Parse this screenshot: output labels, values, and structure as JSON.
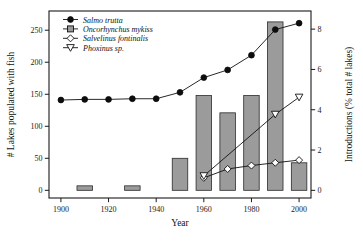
{
  "chart_data": {
    "type": "bar",
    "title": "",
    "xlabel": "Year",
    "ylabel": "# Lakes populated with fish",
    "y2label": "Introductions (% total # lakes)",
    "x": [
      1900,
      1910,
      1920,
      1930,
      1940,
      1950,
      1960,
      1970,
      1980,
      1990,
      2000
    ],
    "xlim": [
      1895,
      2005
    ],
    "xticks": [
      1900,
      1920,
      1940,
      1960,
      1980,
      2000
    ],
    "xticklabels": [
      "1900",
      "1920",
      "1940",
      "1960",
      "1980",
      "2000"
    ],
    "ylim": [
      -12,
      280
    ],
    "yticks": [
      0,
      50,
      100,
      150,
      200,
      250
    ],
    "yticklabels": [
      "0",
      "50",
      "100",
      "150",
      "200",
      "250"
    ],
    "y2lim": [
      -0.38,
      8.9
    ],
    "y2ticks": [
      0,
      2,
      4,
      6,
      8
    ],
    "y2ticklabels": [
      "0",
      "2",
      "4",
      "6",
      "8"
    ],
    "grid": false,
    "legend_position": "top-left",
    "series": [
      {
        "name": "Salmo trutta",
        "kind": "line",
        "axis": "left",
        "marker": "filled-circle",
        "x": [
          1900,
          1910,
          1920,
          1930,
          1940,
          1950,
          1960,
          1970,
          1980,
          1990,
          2000
        ],
        "values": [
          141,
          142,
          142,
          143,
          143,
          153,
          176,
          188,
          211,
          251,
          261
        ]
      },
      {
        "name": "Oncorhynchus mykiss",
        "kind": "bar",
        "axis": "left",
        "marker": "open-square",
        "x": [
          1910,
          1930,
          1950,
          1960,
          1970,
          1980,
          1990,
          2000
        ],
        "values": [
          7,
          7,
          50,
          148,
          121,
          148,
          263,
          43
        ]
      },
      {
        "name": "Salvelinus fontinalis",
        "kind": "line",
        "axis": "right",
        "marker": "open-diamond",
        "x": [
          1960,
          1970,
          1980,
          1990,
          2000
        ],
        "values": [
          0.62,
          1.06,
          1.23,
          1.37,
          1.5
        ]
      },
      {
        "name": "Phoxinus sp.",
        "kind": "line",
        "axis": "right",
        "marker": "open-down-triangle",
        "x": [
          1960,
          1990,
          2000
        ],
        "values": [
          0.72,
          3.77,
          4.62
        ]
      }
    ]
  },
  "legend": {
    "items": [
      {
        "label": "Salmo trutta",
        "marker": "filled-circle"
      },
      {
        "label": "Oncorhynchus mykiss",
        "marker": "open-square"
      },
      {
        "label": "Salvelinus fontinalis",
        "marker": "open-diamond"
      },
      {
        "label": "Phoxinus sp.",
        "marker": "open-down-triangle"
      }
    ]
  },
  "colors": {
    "bar_fill": "#9b9b9b",
    "bar_stroke": "#2b2b2b",
    "line": "#111111",
    "axis": "#1a1a1a",
    "background": "#ffffff"
  }
}
